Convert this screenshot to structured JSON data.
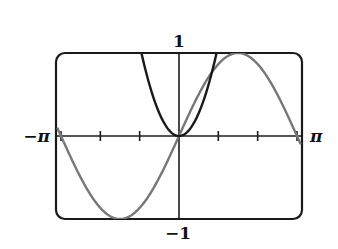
{
  "chart_data": {
    "type": "line",
    "title": "",
    "xlabel": "",
    "ylabel": "",
    "xlim": [
      -3.14159,
      3.14159
    ],
    "ylim": [
      -1,
      1
    ],
    "grid": false,
    "legend": null,
    "axis_labels": {
      "x_min": "−π",
      "x_max": "π",
      "y_max": "1",
      "y_min": "−1"
    },
    "x_ticks": [
      -3.14159,
      -2.0944,
      -1.0472,
      1.0472,
      2.0944,
      3.14159
    ],
    "x_tick_spacing": "π/3",
    "series": [
      {
        "name": "y = x^2",
        "function": "x^2",
        "color": "#1a1a1a",
        "x": [
          -1.0,
          -0.75,
          -0.5,
          -0.25,
          0,
          0.25,
          0.5,
          0.75,
          1.0
        ],
        "y": [
          1.0,
          0.5625,
          0.25,
          0.0625,
          0,
          0.0625,
          0.25,
          0.5625,
          1.0
        ]
      },
      {
        "name": "y = sin(x)",
        "function": "sin(x)",
        "color": "#777777",
        "x": [
          -3.14159,
          -2.3562,
          -1.5708,
          -0.7854,
          0,
          0.7854,
          1.5708,
          2.3562,
          3.14159
        ],
        "y": [
          0,
          -0.7071,
          -1,
          -0.7071,
          0,
          0.7071,
          1,
          0.7071,
          0
        ]
      }
    ]
  },
  "colors": {
    "frame": "#1a1a1a",
    "axes": "#1a1a1a",
    "parabola": "#1a1a1a",
    "sine": "#777777"
  }
}
